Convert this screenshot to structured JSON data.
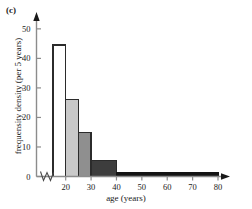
{
  "figure": {
    "panel_label": "(c)",
    "background_color": "#ffffff"
  },
  "chart_data": {
    "type": "bar",
    "title": "",
    "subtitle": "",
    "xlabel": "age (years)",
    "ylabel": "frequensity density (per 5 years)",
    "xlim": [
      15,
      80
    ],
    "ylim": [
      0,
      53
    ],
    "xticks": [
      20,
      30,
      40,
      50,
      60,
      70,
      80
    ],
    "xtick_labels": [
      "20",
      "30",
      "40",
      "50",
      "60",
      "70",
      "80"
    ],
    "yticks": [
      0,
      10,
      20,
      30,
      40,
      50
    ],
    "ytick_labels": [
      "0",
      "10",
      "20",
      "30",
      "40",
      "50"
    ],
    "grid": false,
    "legend": null,
    "axis_break": {
      "axis": "x",
      "symbol": "zigzag",
      "position_note": "between origin and first bin"
    },
    "bins": [
      {
        "label": "15-20",
        "x0": 15,
        "x1": 20,
        "value": 44.5,
        "fill": "#ffffff",
        "edge": "#2b2b2b"
      },
      {
        "label": "20-25",
        "x0": 20,
        "x1": 25,
        "value": 26.0,
        "fill": "#c9c9c9",
        "edge": "#2b2b2b"
      },
      {
        "label": "25-30",
        "x0": 25,
        "x1": 30,
        "value": 15.0,
        "fill": "#8f8f8f",
        "edge": "#2b2b2b"
      },
      {
        "label": "30-40",
        "x0": 30,
        "x1": 40,
        "value": 5.5,
        "fill": "#3d3d3d",
        "edge": "#2b2b2b"
      },
      {
        "label": "40-80",
        "x0": 40,
        "x1": 80,
        "value": 1.3,
        "fill": "#141414",
        "edge": "#141414"
      }
    ],
    "categories": [
      "15-20",
      "20-25",
      "25-30",
      "30-40",
      "40-80"
    ],
    "values": [
      44.5,
      26.0,
      15.0,
      5.5,
      1.3
    ]
  },
  "icons": {
    "y_axis_arrow": "arrow-up-icon",
    "x_axis_arrow": "arrow-right-icon",
    "break_mark": "axis-break-icon"
  }
}
